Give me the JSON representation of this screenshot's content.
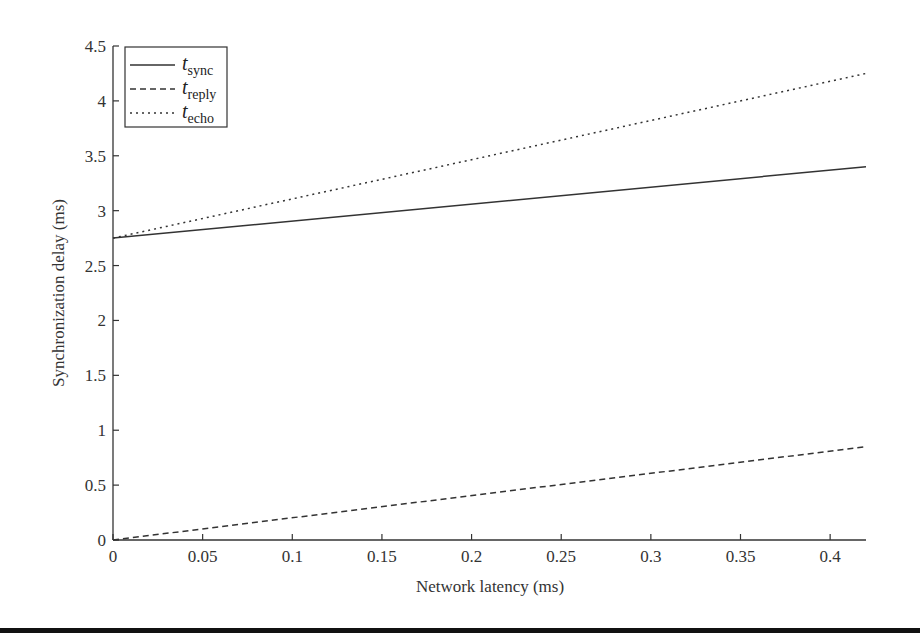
{
  "chart_data": {
    "type": "line",
    "title": "",
    "xlabel": "Network latency (ms)",
    "ylabel": "Synchronization delay (ms)",
    "xlim": [
      0,
      0.42
    ],
    "ylim": [
      0,
      4.5
    ],
    "x_ticks": [
      "0",
      "0.05",
      "0.1",
      "0.15",
      "0.2",
      "0.25",
      "0.3",
      "0.35",
      "0.4"
    ],
    "y_ticks": [
      "0",
      "0.5",
      "1",
      "1.5",
      "2",
      "2.5",
      "3",
      "3.5",
      "4",
      "4.5"
    ],
    "grid": false,
    "legend_position": "upper left",
    "x": [
      0,
      0.42
    ],
    "series": [
      {
        "name": "t_sync",
        "label_main": "t",
        "label_sub": "sync",
        "style": "solid",
        "values": [
          2.75,
          3.4
        ]
      },
      {
        "name": "t_reply",
        "label_main": "t",
        "label_sub": "reply",
        "style": "dashed",
        "values": [
          0.0,
          0.85
        ]
      },
      {
        "name": "t_echo",
        "label_main": "t",
        "label_sub": "echo",
        "style": "dotted",
        "values": [
          2.75,
          4.25
        ]
      }
    ]
  }
}
